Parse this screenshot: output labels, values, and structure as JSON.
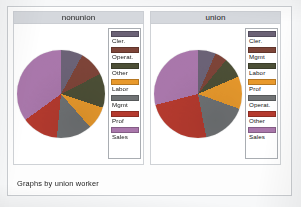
{
  "figure": {
    "note": "Graphs by union worker",
    "background_color": "#fdfdfd",
    "panel_title_bg": "#d5d8dd",
    "legend_border_color": "#a9adb2"
  },
  "palette": {
    "slate_purple": "#6b6276",
    "brown": "#7d4438",
    "olive": "#4c4f36",
    "orange": "#e8992c",
    "gray": "#6f7274",
    "red": "#b53a2e",
    "orchid": "#a977ab"
  },
  "chart_data": [
    {
      "type": "pie",
      "title": "nonunion",
      "legend_position": "right",
      "start_angle": 0,
      "direction": "clockwise",
      "labels": [
        "Cler.",
        "Operat.",
        "Other",
        "Labor",
        "Mgmt",
        "Prof",
        "Sales"
      ],
      "colors": [
        "#6b6276",
        "#7d4438",
        "#4c4f36",
        "#e8992c",
        "#6f7274",
        "#b53a2e",
        "#a977ab"
      ],
      "values": [
        8.0,
        9.5,
        12.5,
        8.5,
        13.0,
        13.5,
        35.0
      ],
      "unit": "percent"
    },
    {
      "type": "pie",
      "title": "union",
      "legend_position": "right",
      "start_angle": 0,
      "direction": "clockwise",
      "labels": [
        "Cler.",
        "Mgmt",
        "Labor",
        "Prof",
        "Operat.",
        "Other",
        "Sales"
      ],
      "colors": [
        "#6b6276",
        "#7d4438",
        "#4c4f36",
        "#e8992c",
        "#6f7274",
        "#b53a2e",
        "#a977ab"
      ],
      "values": [
        6.5,
        4.5,
        7.5,
        12.0,
        16.5,
        24.0,
        29.0
      ],
      "unit": "percent"
    }
  ],
  "panels": [
    {
      "id": "nonunion",
      "title": "nonunion",
      "legend": [
        {
          "label": "Cler.",
          "color": "#6b6276"
        },
        {
          "label": "Operat.",
          "color": "#7d4438"
        },
        {
          "label": "Other",
          "color": "#4c4f36"
        },
        {
          "label": "Labor",
          "color": "#e8992c"
        },
        {
          "label": "Mgmt",
          "color": "#6f7274"
        },
        {
          "label": "Prof",
          "color": "#b53a2e"
        },
        {
          "label": "Sales",
          "color": "#a977ab"
        }
      ]
    },
    {
      "id": "union",
      "title": "union",
      "legend": [
        {
          "label": "Cler.",
          "color": "#6b6276"
        },
        {
          "label": "Mgmt",
          "color": "#7d4438"
        },
        {
          "label": "Labor",
          "color": "#4c4f36"
        },
        {
          "label": "Prof",
          "color": "#e8992c"
        },
        {
          "label": "Operat.",
          "color": "#6f7274"
        },
        {
          "label": "Other",
          "color": "#b53a2e"
        },
        {
          "label": "Sales",
          "color": "#a977ab"
        }
      ]
    }
  ]
}
